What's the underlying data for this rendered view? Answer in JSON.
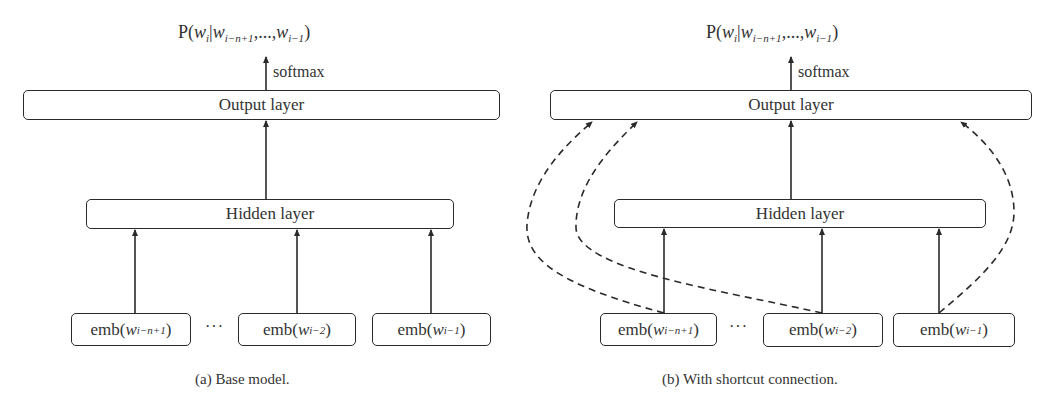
{
  "panels": [
    {
      "id": "a",
      "caption": "(a) Base model.",
      "output_prob": {
        "prefix": "P(",
        "w": "w",
        "i": "i",
        "bar": "|",
        "ctx1": "i−n+1",
        "sep": ",...,",
        "ctx2": "i−1",
        "suffix": ")"
      },
      "softmax_label": "softmax",
      "output_layer_label": "Output layer",
      "hidden_layer_label": "Hidden layer",
      "ellipsis": "···",
      "embeddings": [
        {
          "prefix": "emb(",
          "w": "w",
          "sub": "i−n+1",
          "suffix": ")"
        },
        {
          "prefix": "emb(",
          "w": "w",
          "sub": "i−2",
          "suffix": ")"
        },
        {
          "prefix": "emb(",
          "w": "w",
          "sub": "i−1",
          "suffix": ")"
        }
      ]
    },
    {
      "id": "b",
      "caption": "(b) With shortcut connection.",
      "output_prob": {
        "prefix": "P(",
        "w": "w",
        "i": "i",
        "bar": "|",
        "ctx1": "i−n+1",
        "sep": ",...,",
        "ctx2": "i−1",
        "suffix": ")"
      },
      "softmax_label": "softmax",
      "output_layer_label": "Output layer",
      "hidden_layer_label": "Hidden layer",
      "ellipsis": "···",
      "embeddings": [
        {
          "prefix": "emb(",
          "w": "w",
          "sub": "i−n+1",
          "suffix": ")"
        },
        {
          "prefix": "emb(",
          "w": "w",
          "sub": "i−2",
          "suffix": ")"
        },
        {
          "prefix": "emb(",
          "w": "w",
          "sub": "i−1",
          "suffix": ")"
        }
      ],
      "shortcut_connections": "dashed arrows from each embedding directly to the output layer"
    }
  ],
  "colors": {
    "stroke": "#2a2a2a",
    "text": "#333333",
    "background": "#ffffff"
  }
}
